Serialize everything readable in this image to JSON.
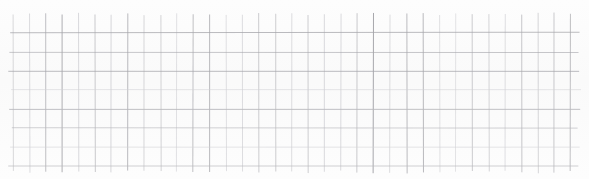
{
  "document": {
    "kind": "scanned-grid-paper",
    "width": 589,
    "height": 179,
    "background_color": "#ffffff",
    "paper_tint": "#fdfdfd",
    "has_text": false,
    "has_annotations": false,
    "caption": ""
  },
  "grid": {
    "label": "graph-paper-grid",
    "line_color": "#b9b9bd",
    "line_color_light": "#d2d2d6",
    "line_color_dark": "#a6a6ab",
    "vertical": {
      "count": 35,
      "spacing_px": 16.4,
      "start_x": 13,
      "end_x": 576,
      "top_y": 14,
      "bottom_y": 172,
      "stroke_width": 0.9
    },
    "horizontal": {
      "count": 8,
      "spacing_px": 19.0,
      "start_y": 33,
      "end_y": 166,
      "left_x": 10,
      "right_x": 579,
      "stroke_width": 0.9
    },
    "margins": {
      "top_blank_px": 14,
      "bottom_blank_px": 7,
      "left_blank_px": 13,
      "right_blank_px": 13
    }
  },
  "chart_data": {
    "type": "table",
    "title": "",
    "xlabel": "",
    "ylabel": "",
    "categories": [],
    "values": []
  }
}
